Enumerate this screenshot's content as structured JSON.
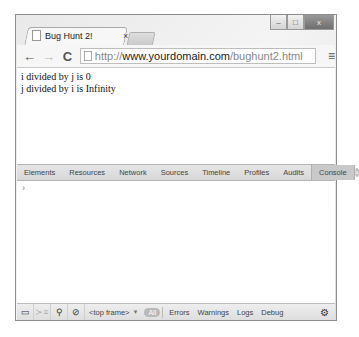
{
  "window": {
    "controls": {
      "minimize": "–",
      "maximize": "□",
      "close": "x"
    }
  },
  "tab": {
    "title": "Bug Hunt 2!",
    "close": "×"
  },
  "toolbar": {
    "back": "←",
    "forward": "→",
    "reload": "C",
    "url_scheme": "http://",
    "url_host": "www.yourdomain.com",
    "url_path": "/bughunt2.html",
    "menu": "≡"
  },
  "page": {
    "lines": [
      "i divided by j is 0",
      "j divided by i is Infinity"
    ]
  },
  "devtools": {
    "tabs": [
      "Elements",
      "Resources",
      "Network",
      "Sources",
      "Timeline",
      "Profiles",
      "Audits",
      "Console"
    ],
    "active_tab": "Console",
    "close": "×",
    "console_prompt": "›",
    "statusbar": {
      "frame": "<top frame>",
      "frame_arrow": "▼",
      "all": "All",
      "filters": [
        "Errors",
        "Warnings",
        "Logs",
        "Debug"
      ]
    }
  }
}
